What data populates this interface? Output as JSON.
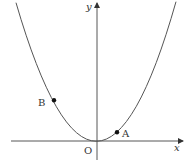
{
  "diagram": {
    "type": "coordinate-plane-parabola",
    "axes": {
      "x_label": "x",
      "y_label": "y",
      "origin_label": "O"
    },
    "curve": {
      "equation": "y = a x^2",
      "vertex": "O"
    },
    "points": [
      {
        "label": "A",
        "side": "right",
        "description": "point on the parabola close to the origin, x > 0"
      },
      {
        "label": "B",
        "side": "left",
        "description": "point on the parabola, x < 0, higher than A"
      }
    ],
    "colors": {
      "curve": "#555555",
      "axes": "#444444",
      "points": "#111111",
      "text": "#333333"
    }
  }
}
